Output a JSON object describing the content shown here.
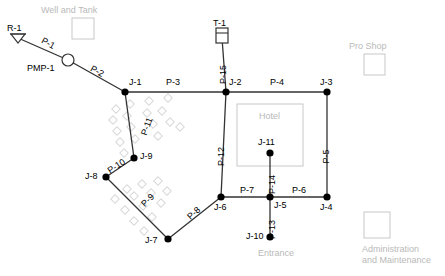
{
  "diagram": {
    "colors": {
      "pipe": "#333333",
      "node": "#000000",
      "label": "#000000",
      "building": "#c8c8c8",
      "building_text": "#b9b9b9",
      "landscape": "#d8d8d8"
    }
  },
  "buildings": [
    {
      "name": "well-and-tank",
      "label": "Well and Tank",
      "label_x": 41,
      "label_y": 5,
      "box_x": 72,
      "box_y": 18,
      "box_w": 22,
      "box_h": 21
    },
    {
      "name": "pro-shop",
      "label": "Pro Shop",
      "label_x": 349,
      "label_y": 41,
      "box_x": 364,
      "box_y": 54,
      "box_w": 21,
      "box_h": 21
    },
    {
      "name": "hotel",
      "label": "Hotel",
      "label_x": 259,
      "label_y": 111,
      "box_x": 237,
      "box_y": 104,
      "box_w": 66,
      "box_h": 62
    },
    {
      "name": "entrance",
      "label": "Entrance",
      "label_x": 258,
      "label_y": 248,
      "box_x": null,
      "box_y": null,
      "box_w": null,
      "box_h": null
    },
    {
      "name": "administration-and-maintenance",
      "label": "Administration",
      "label2": "and Maintenance",
      "label_x": 362,
      "label_y": 244,
      "box_x": 364,
      "box_y": 212,
      "box_w": 26,
      "box_h": 26
    }
  ],
  "nodes": [
    {
      "id": "R-1",
      "kind": "reservoir",
      "x": 18,
      "y": 38,
      "label_x": 7,
      "label_y": 24
    },
    {
      "id": "PMP-1",
      "kind": "pump",
      "x": 68,
      "y": 60,
      "label_x": 27,
      "label_y": 64
    },
    {
      "id": "T-1",
      "kind": "tank",
      "x": 222,
      "y": 38,
      "label_x": 213,
      "label_y": 19
    },
    {
      "id": "J-1",
      "kind": "junction",
      "x": 125,
      "y": 92,
      "label_x": 129,
      "label_y": 78
    },
    {
      "id": "J-2",
      "kind": "junction",
      "x": 226,
      "y": 92,
      "label_x": 229,
      "label_y": 78
    },
    {
      "id": "J-3",
      "kind": "junction",
      "x": 327,
      "y": 92,
      "label_x": 320,
      "label_y": 78
    },
    {
      "id": "J-4",
      "kind": "junction",
      "x": 327,
      "y": 197,
      "label_x": 320,
      "label_y": 203
    },
    {
      "id": "J-5",
      "kind": "junction",
      "x": 270,
      "y": 197,
      "label_x": 274,
      "label_y": 201
    },
    {
      "id": "J-6",
      "kind": "junction",
      "x": 221,
      "y": 197,
      "label_x": 214,
      "label_y": 203
    },
    {
      "id": "J-7",
      "kind": "junction",
      "x": 168,
      "y": 239,
      "label_x": 145,
      "label_y": 236
    },
    {
      "id": "J-8",
      "kind": "junction",
      "x": 106,
      "y": 177,
      "label_x": 85,
      "label_y": 172
    },
    {
      "id": "J-9",
      "kind": "junction",
      "x": 134,
      "y": 158,
      "label_x": 140,
      "label_y": 152
    },
    {
      "id": "J-10",
      "kind": "junction",
      "x": 270,
      "y": 237,
      "label_x": 246,
      "label_y": 232
    },
    {
      "id": "J-11",
      "kind": "junction",
      "x": 270,
      "y": 153,
      "label_x": 258,
      "label_y": 138
    }
  ],
  "pipes": [
    {
      "id": "P-1",
      "from": "R-1",
      "to": "PMP-1",
      "label_x": 41,
      "label_y": 39,
      "rot": 28
    },
    {
      "id": "P-2",
      "from": "PMP-1",
      "to": "J-1",
      "label_x": 90,
      "label_y": 67,
      "rot": 28
    },
    {
      "id": "P-3",
      "from": "J-1",
      "to": "J-2",
      "label_x": 166,
      "label_y": 78,
      "rot": 0
    },
    {
      "id": "P-4",
      "from": "J-2",
      "to": "J-3",
      "label_x": 270,
      "label_y": 78,
      "rot": 0
    },
    {
      "id": "P-5",
      "from": "J-3",
      "to": "J-4",
      "label_x": 319,
      "label_y": 152,
      "rot": -90
    },
    {
      "id": "P-6",
      "from": "J-5",
      "to": "J-4",
      "label_x": 292,
      "label_y": 186,
      "rot": 0
    },
    {
      "id": "P-7",
      "from": "J-6",
      "to": "J-5",
      "label_x": 240,
      "label_y": 186,
      "rot": 0
    },
    {
      "id": "P-8",
      "from": "J-7",
      "to": "J-6",
      "label_x": 187,
      "label_y": 209,
      "rot": -42
    },
    {
      "id": "P-9",
      "from": "J-8",
      "to": "J-7",
      "label_x": 141,
      "label_y": 196,
      "rot": -45
    },
    {
      "id": "P-10",
      "from": "J-8",
      "to": "J-9",
      "label_x": 107,
      "label_y": 162,
      "rot": -33
    },
    {
      "id": "P-11",
      "from": "J-1",
      "to": "J-9",
      "label_x": 138,
      "label_y": 122,
      "rot": -70
    },
    {
      "id": "P-12",
      "from": "J-2",
      "to": "J-6",
      "label_x": 212,
      "label_y": 152,
      "rot": -90
    },
    {
      "id": "P-13",
      "from": "J-5",
      "to": "J-10",
      "label_x": 263,
      "label_y": 225,
      "rot": -90
    },
    {
      "id": "P-14",
      "from": "J-11",
      "to": "J-5",
      "label_x": 263,
      "label_y": 180,
      "rot": -90
    },
    {
      "id": "P-15",
      "from": "T-1",
      "to": "J-2",
      "label_x": 214,
      "label_y": 70,
      "rot": -90
    }
  ],
  "landscape_squares": [
    {
      "x": 113,
      "y": 106
    },
    {
      "x": 127,
      "y": 101
    },
    {
      "x": 146,
      "y": 98
    },
    {
      "x": 165,
      "y": 95
    },
    {
      "x": 110,
      "y": 117
    },
    {
      "x": 124,
      "y": 113
    },
    {
      "x": 144,
      "y": 110
    },
    {
      "x": 159,
      "y": 108
    },
    {
      "x": 114,
      "y": 128
    },
    {
      "x": 128,
      "y": 124
    },
    {
      "x": 150,
      "y": 121
    },
    {
      "x": 167,
      "y": 119
    },
    {
      "x": 117,
      "y": 139
    },
    {
      "x": 132,
      "y": 136
    },
    {
      "x": 155,
      "y": 133
    },
    {
      "x": 121,
      "y": 150
    },
    {
      "x": 177,
      "y": 124
    },
    {
      "x": 124,
      "y": 186
    },
    {
      "x": 139,
      "y": 181
    },
    {
      "x": 155,
      "y": 178
    },
    {
      "x": 112,
      "y": 196
    },
    {
      "x": 131,
      "y": 193
    },
    {
      "x": 148,
      "y": 190
    },
    {
      "x": 164,
      "y": 188
    },
    {
      "x": 122,
      "y": 207
    },
    {
      "x": 140,
      "y": 203
    },
    {
      "x": 158,
      "y": 200
    },
    {
      "x": 131,
      "y": 218
    },
    {
      "x": 149,
      "y": 214
    },
    {
      "x": 141,
      "y": 228
    }
  ]
}
